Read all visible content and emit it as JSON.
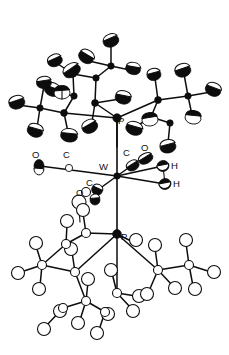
{
  "figure": {
    "kind": "ortep-crystal-structure",
    "title": "",
    "caption": "",
    "width": 229,
    "height": 355,
    "background": "#ffffff",
    "line_color": "#0d0d0d",
    "solid_fill": "#0d0d0d",
    "open_fill": "#ffffff"
  },
  "labels": [
    {
      "id": "P-top",
      "text": "P",
      "x": 118,
      "y": 124
    },
    {
      "id": "O-left",
      "text": "O",
      "x": 32,
      "y": 158
    },
    {
      "id": "C-left",
      "text": "C",
      "x": 63,
      "y": 158
    },
    {
      "id": "W-center",
      "text": "W",
      "x": 105,
      "y": 170
    },
    {
      "id": "C-upper",
      "text": "C",
      "x": 126,
      "y": 156
    },
    {
      "id": "O-upper",
      "text": "O",
      "x": 143,
      "y": 151
    },
    {
      "id": "H-upper",
      "text": "H",
      "x": 171,
      "y": 168
    },
    {
      "id": "H-lower",
      "text": "H",
      "x": 173,
      "y": 186
    },
    {
      "id": "C-lower",
      "text": "C",
      "x": 88,
      "y": 185
    },
    {
      "id": "O-lower",
      "text": "O",
      "x": 78,
      "y": 196
    },
    {
      "id": "P-bottom",
      "text": "P",
      "x": 122,
      "y": 240
    }
  ],
  "legend": {
    "top_group": "tert-butyl phosphine (solid thermal ellipsoids)",
    "bottom_group": "tert-butyl phosphine (open thermal ellipsoids)",
    "center_atom": "W"
  }
}
